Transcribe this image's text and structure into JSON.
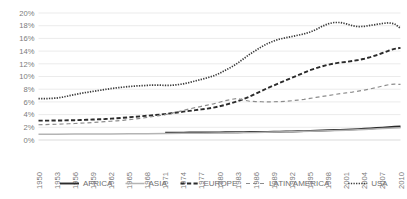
{
  "chart_data": {
    "type": "line",
    "title": "",
    "xlabel": "",
    "ylabel": "",
    "ylim": [
      0,
      20
    ],
    "ytick_labels": [
      "0%",
      "2%",
      "4%",
      "6%",
      "8%",
      "10%",
      "12%",
      "14%",
      "16%",
      "18%",
      "20%"
    ],
    "ytick_values": [
      0,
      2,
      4,
      6,
      8,
      10,
      12,
      14,
      16,
      18,
      20
    ],
    "grid": true,
    "legend_position": "bottom",
    "x": [
      1950,
      1951,
      1952,
      1953,
      1954,
      1955,
      1956,
      1957,
      1958,
      1959,
      1960,
      1961,
      1962,
      1963,
      1964,
      1965,
      1966,
      1967,
      1968,
      1969,
      1970,
      1971,
      1972,
      1973,
      1974,
      1975,
      1976,
      1977,
      1978,
      1979,
      1980,
      1981,
      1982,
      1983,
      1984,
      1985,
      1986,
      1987,
      1988,
      1989,
      1990,
      1991,
      1992,
      1993,
      1994,
      1995,
      1996,
      1997,
      1998,
      1999,
      2000,
      2001,
      2002,
      2003,
      2004,
      2005,
      2006,
      2007,
      2008,
      2009,
      2010
    ],
    "xtick_labels": [
      "1950",
      "1953",
      "1956",
      "1959",
      "1962",
      "1965",
      "1968",
      "1971",
      "1974",
      "1977",
      "1980",
      "1983",
      "1986",
      "1989",
      "1992",
      "1995",
      "1998",
      "2001",
      "2004",
      "2007",
      "2010"
    ],
    "xtick_values": [
      1950,
      1953,
      1956,
      1959,
      1962,
      1965,
      1968,
      1971,
      1974,
      1977,
      1980,
      1983,
      1986,
      1989,
      1992,
      1995,
      1998,
      2001,
      2004,
      2007,
      2010
    ],
    "series": [
      {
        "name": "AFRICA",
        "style": "solid-thick",
        "color": "#2b2b2b",
        "x": [
          1971,
          1972,
          1973,
          1974,
          1975,
          1976,
          1977,
          1978,
          1979,
          1980,
          1981,
          1982,
          1983,
          1984,
          1985,
          1986,
          1987,
          1988,
          1989,
          1990,
          1991,
          1992,
          1993,
          1994,
          1995,
          1996,
          1997,
          1998,
          1999,
          2000,
          2001,
          2002,
          2003,
          2004,
          2005,
          2006,
          2007,
          2008,
          2009,
          2010
        ],
        "values": [
          1.15,
          1.15,
          1.16,
          1.16,
          1.17,
          1.18,
          1.18,
          1.19,
          1.2,
          1.2,
          1.21,
          1.22,
          1.23,
          1.24,
          1.25,
          1.26,
          1.27,
          1.28,
          1.3,
          1.31,
          1.33,
          1.35,
          1.37,
          1.4,
          1.43,
          1.46,
          1.5,
          1.53,
          1.57,
          1.6,
          1.64,
          1.68,
          1.72,
          1.77,
          1.82,
          1.88,
          1.95,
          2.02,
          2.08,
          2.12
        ]
      },
      {
        "name": "ASIA",
        "style": "solid-thin",
        "color": "#b4b4b4",
        "x": [
          1950,
          1953,
          1956,
          1959,
          1962,
          1965,
          1968,
          1971,
          1974,
          1977,
          1980,
          1983,
          1986,
          1989,
          1992,
          1995,
          1998,
          2001,
          2004,
          2007,
          2010
        ],
        "values": [
          0.9,
          0.92,
          0.93,
          0.95,
          0.96,
          0.98,
          1.0,
          1.02,
          1.05,
          1.08,
          1.12,
          1.16,
          1.2,
          1.25,
          1.3,
          1.37,
          1.45,
          1.55,
          1.66,
          1.8,
          1.92
        ]
      },
      {
        "name": "EUROPE",
        "style": "dashed-thick",
        "color": "#2b2b2b",
        "x": [
          1950,
          1951,
          1952,
          1953,
          1954,
          1955,
          1956,
          1957,
          1958,
          1959,
          1960,
          1961,
          1962,
          1963,
          1964,
          1965,
          1966,
          1967,
          1968,
          1969,
          1970,
          1971,
          1972,
          1973,
          1974,
          1975,
          1976,
          1977,
          1978,
          1979,
          1980,
          1981,
          1982,
          1983,
          1984,
          1985,
          1986,
          1987,
          1988,
          1989,
          1990,
          1991,
          1992,
          1993,
          1994,
          1995,
          1996,
          1997,
          1998,
          1999,
          2000,
          2001,
          2002,
          2003,
          2004,
          2005,
          2006,
          2007,
          2008,
          2009,
          2010
        ],
        "values": [
          3.05,
          3.05,
          3.06,
          3.07,
          3.08,
          3.1,
          3.12,
          3.15,
          3.18,
          3.22,
          3.26,
          3.3,
          3.36,
          3.42,
          3.5,
          3.58,
          3.66,
          3.74,
          3.82,
          3.9,
          4.0,
          4.1,
          4.22,
          4.34,
          4.46,
          4.58,
          4.7,
          4.82,
          4.95,
          5.1,
          5.3,
          5.55,
          5.82,
          6.1,
          6.45,
          6.85,
          7.3,
          7.75,
          8.2,
          8.6,
          9.0,
          9.4,
          9.8,
          10.2,
          10.6,
          11.0,
          11.3,
          11.6,
          11.85,
          12.05,
          12.2,
          12.3,
          12.45,
          12.6,
          12.8,
          13.05,
          13.35,
          13.7,
          14.05,
          14.35,
          14.5
        ]
      },
      {
        "name": "LATIN AMERICA",
        "style": "dashed-thin",
        "color": "#8c8c8c",
        "x": [
          1950,
          1951,
          1952,
          1953,
          1954,
          1955,
          1956,
          1957,
          1958,
          1959,
          1960,
          1961,
          1962,
          1963,
          1964,
          1965,
          1966,
          1967,
          1968,
          1969,
          1970,
          1971,
          1972,
          1973,
          1974,
          1975,
          1976,
          1977,
          1978,
          1979,
          1980,
          1981,
          1982,
          1983,
          1984,
          1985,
          1986,
          1987,
          1988,
          1989,
          1990,
          1991,
          1992,
          1993,
          1994,
          1995,
          1996,
          1997,
          1998,
          1999,
          2000,
          2001,
          2002,
          2003,
          2004,
          2005,
          2006,
          2007,
          2008,
          2009,
          2010
        ],
        "values": [
          2.4,
          2.42,
          2.45,
          2.48,
          2.52,
          2.56,
          2.6,
          2.65,
          2.7,
          2.76,
          2.82,
          2.88,
          2.95,
          3.02,
          3.1,
          3.2,
          3.3,
          3.42,
          3.55,
          3.7,
          3.85,
          4.0,
          4.2,
          4.42,
          4.65,
          4.9,
          5.1,
          5.3,
          5.5,
          5.7,
          5.95,
          6.2,
          6.4,
          6.55,
          6.3,
          6.1,
          6.05,
          6.02,
          6.0,
          6.02,
          6.05,
          6.1,
          6.18,
          6.28,
          6.4,
          6.55,
          6.7,
          6.85,
          7.0,
          7.15,
          7.3,
          7.42,
          7.55,
          7.7,
          7.85,
          8.05,
          8.25,
          8.5,
          8.7,
          8.8,
          8.75
        ]
      },
      {
        "name": "USA",
        "style": "dotted",
        "color": "#3a3a3a",
        "x": [
          1950,
          1951,
          1952,
          1953,
          1954,
          1955,
          1956,
          1957,
          1958,
          1959,
          1960,
          1961,
          1962,
          1963,
          1964,
          1965,
          1966,
          1967,
          1968,
          1969,
          1970,
          1971,
          1972,
          1973,
          1974,
          1975,
          1976,
          1977,
          1978,
          1979,
          1980,
          1981,
          1982,
          1983,
          1984,
          1985,
          1986,
          1987,
          1988,
          1989,
          1990,
          1991,
          1992,
          1993,
          1994,
          1995,
          1996,
          1997,
          1998,
          1999,
          2000,
          2001,
          2002,
          2003,
          2004,
          2005,
          2006,
          2007,
          2008,
          2009,
          2010
        ],
        "values": [
          6.5,
          6.5,
          6.55,
          6.6,
          6.75,
          6.95,
          7.15,
          7.35,
          7.5,
          7.65,
          7.8,
          7.95,
          8.1,
          8.22,
          8.32,
          8.42,
          8.5,
          8.55,
          8.6,
          8.65,
          8.65,
          8.6,
          8.62,
          8.7,
          8.85,
          9.05,
          9.3,
          9.55,
          9.8,
          10.1,
          10.5,
          11.0,
          11.5,
          12.1,
          12.8,
          13.5,
          14.1,
          14.7,
          15.2,
          15.6,
          15.9,
          16.1,
          16.3,
          16.5,
          16.7,
          17.0,
          17.4,
          17.9,
          18.3,
          18.5,
          18.5,
          18.3,
          18.0,
          17.85,
          17.9,
          18.05,
          18.2,
          18.35,
          18.45,
          18.3,
          17.6
        ]
      }
    ]
  },
  "legend": {
    "items": [
      {
        "label": "AFRICA"
      },
      {
        "label": "ASIA"
      },
      {
        "label": "EUROPE"
      },
      {
        "label": "LATIN AMERICA"
      },
      {
        "label": "USA"
      }
    ]
  }
}
